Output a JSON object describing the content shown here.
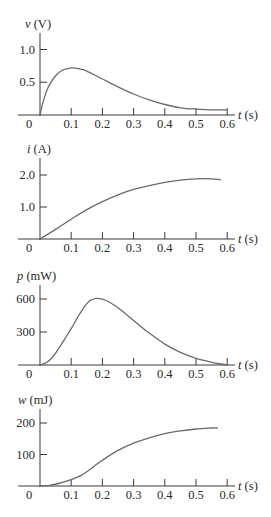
{
  "chart_data": [
    {
      "type": "line",
      "title": "",
      "ylabel": "v (V)",
      "ylabel_var": "v",
      "ylabel_unit": "(V)",
      "xlabel": "t (s)",
      "xlabel_var": "t",
      "xlabel_unit": "(s)",
      "xticks": [
        "0",
        "0.1",
        "0.2",
        "0.3",
        "0.4",
        "0.5",
        "0.6"
      ],
      "yticks": [
        {
          "value": 0.5,
          "label": "0.5"
        },
        {
          "value": 1.0,
          "label": "1.0"
        }
      ],
      "xlim": [
        0,
        0.6
      ],
      "ylim": [
        0,
        1.2
      ],
      "grid": false,
      "series": [
        {
          "name": "v",
          "x": [
            0,
            0.01,
            0.02,
            0.03,
            0.05,
            0.07,
            0.1,
            0.13,
            0.15,
            0.2,
            0.25,
            0.3,
            0.35,
            0.4,
            0.45,
            0.5,
            0.55,
            0.6
          ],
          "y": [
            0,
            0.2,
            0.35,
            0.46,
            0.6,
            0.68,
            0.72,
            0.7,
            0.67,
            0.55,
            0.43,
            0.32,
            0.23,
            0.16,
            0.11,
            0.09,
            0.08,
            0.08
          ]
        }
      ]
    },
    {
      "type": "line",
      "title": "",
      "ylabel": "i (A)",
      "ylabel_var": "i",
      "ylabel_unit": "(A)",
      "xlabel": "t (s)",
      "xlabel_var": "t",
      "xlabel_unit": "(s)",
      "xticks": [
        "0",
        "0.1",
        "0.2",
        "0.3",
        "0.4",
        "0.5",
        "0.6"
      ],
      "yticks": [
        {
          "value": 1.0,
          "label": "1.0"
        },
        {
          "value": 2.0,
          "label": "2.0"
        }
      ],
      "xlim": [
        0,
        0.6
      ],
      "ylim": [
        0,
        2.4
      ],
      "grid": false,
      "series": [
        {
          "name": "i",
          "x": [
            0,
            0.05,
            0.1,
            0.15,
            0.2,
            0.25,
            0.3,
            0.35,
            0.4,
            0.45,
            0.5,
            0.55,
            0.58
          ],
          "y": [
            0,
            0.3,
            0.62,
            0.92,
            1.17,
            1.38,
            1.55,
            1.67,
            1.77,
            1.84,
            1.88,
            1.88,
            1.85
          ]
        }
      ]
    },
    {
      "type": "line",
      "title": "",
      "ylabel": "p (mW)",
      "ylabel_var": "p",
      "ylabel_unit": "(mW)",
      "xlabel": "t (s)",
      "xlabel_var": "t",
      "xlabel_unit": "(s)",
      "xticks": [
        "0",
        "0.1",
        "0.2",
        "0.3",
        "0.4",
        "0.5",
        "0.6"
      ],
      "yticks": [
        {
          "value": 300,
          "label": "300"
        },
        {
          "value": 600,
          "label": "600"
        }
      ],
      "xlim": [
        0,
        0.6
      ],
      "ylim": [
        0,
        720
      ],
      "grid": false,
      "series": [
        {
          "name": "p",
          "x": [
            0,
            0.02,
            0.04,
            0.06,
            0.08,
            0.1,
            0.12,
            0.14,
            0.16,
            0.18,
            0.2,
            0.22,
            0.25,
            0.3,
            0.35,
            0.4,
            0.45,
            0.5,
            0.55,
            0.6
          ],
          "y": [
            0,
            20,
            70,
            150,
            240,
            330,
            430,
            520,
            585,
            605,
            598,
            575,
            520,
            405,
            290,
            190,
            115,
            60,
            25,
            0
          ]
        }
      ]
    },
    {
      "type": "line",
      "title": "",
      "ylabel": "w (mJ)",
      "ylabel_var": "w",
      "ylabel_unit": "(mJ)",
      "xlabel": "t (s)",
      "xlabel_var": "t",
      "xlabel_unit": "(s)",
      "xticks": [
        "0",
        "0.1",
        "0.2",
        "0.3",
        "0.4",
        "0.5",
        "0.6"
      ],
      "yticks": [
        {
          "value": 100,
          "label": "100"
        },
        {
          "value": 200,
          "label": "200"
        }
      ],
      "xlim": [
        0,
        0.6
      ],
      "ylim": [
        0,
        240
      ],
      "grid": false,
      "series": [
        {
          "name": "w",
          "x": [
            0,
            0.03,
            0.06,
            0.1,
            0.13,
            0.15,
            0.18,
            0.2,
            0.25,
            0.3,
            0.35,
            0.4,
            0.45,
            0.5,
            0.55,
            0.57
          ],
          "y": [
            0,
            2,
            8,
            20,
            33,
            45,
            68,
            82,
            113,
            136,
            153,
            166,
            175,
            181,
            184,
            184
          ]
        }
      ]
    }
  ]
}
